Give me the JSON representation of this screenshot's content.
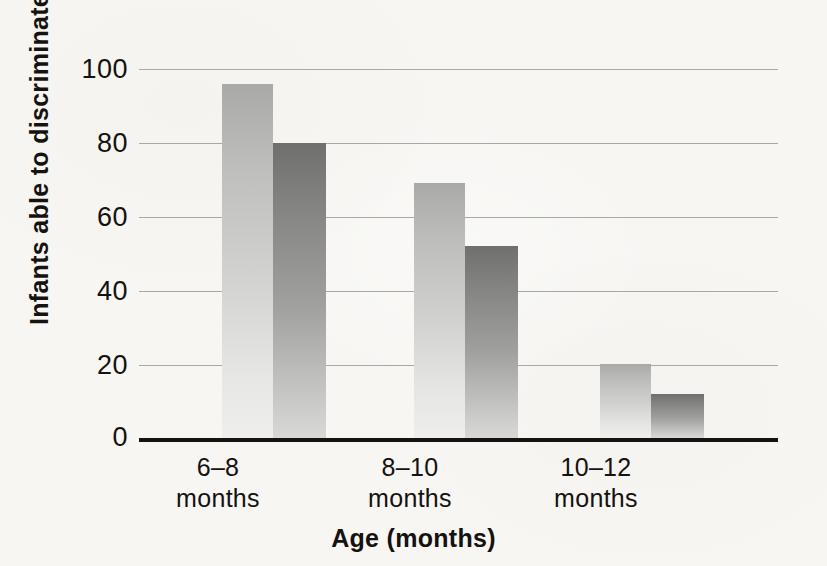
{
  "chart_data": {
    "type": "bar",
    "title": "",
    "xlabel": "Age (months)",
    "ylabel": "Infants able to discriminate (%)",
    "categories": [
      "6–8\nmonths",
      "8–10\nmonths",
      "10–12\nmonths"
    ],
    "category_labels": [
      {
        "range": "6–8",
        "unit": "months"
      },
      {
        "range": "8–10",
        "unit": "months"
      },
      {
        "range": "10–12",
        "unit": "months"
      }
    ],
    "series": [
      {
        "name": "light-bar",
        "color": "#c0c0be",
        "values": [
          96,
          69,
          20
        ]
      },
      {
        "name": "dark-bar",
        "color": "#8a8a88",
        "values": [
          80,
          52,
          12
        ]
      }
    ],
    "ylim": [
      0,
      100
    ],
    "yticks": [
      0,
      20,
      40,
      60,
      80,
      100
    ],
    "ytick_labels": [
      "0",
      "20",
      "40",
      "60",
      "80",
      "100"
    ],
    "grid": true,
    "legend": "none",
    "legend_position": "none"
  },
  "axis": {
    "y_title": "Infants able to discriminate (%)",
    "x_title": "Age (months)"
  },
  "colors": {
    "background": "#f7f6f3",
    "axis_line": "#15120f",
    "gridline": "#9a9a98",
    "text": "#15120f",
    "bar_light_top": "#a9a9a7",
    "bar_light_bottom": "#eeeeec",
    "bar_dark_top": "#6f6f6d",
    "bar_dark_bottom": "#d8d8d6"
  }
}
